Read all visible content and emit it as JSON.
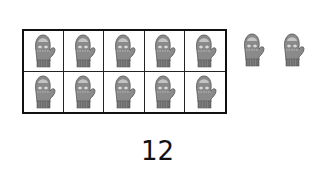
{
  "ten_frame": {
    "rows": 2,
    "columns": 5,
    "cells": [
      {
        "filled": true
      },
      {
        "filled": true
      },
      {
        "filled": true
      },
      {
        "filled": true
      },
      {
        "filled": true
      },
      {
        "filled": true
      },
      {
        "filled": true
      },
      {
        "filled": true
      },
      {
        "filled": true
      },
      {
        "filled": true
      }
    ],
    "item_icon": "mitten-icon"
  },
  "extra_items": [
    {
      "icon": "mitten-icon"
    },
    {
      "icon": "mitten-icon"
    }
  ],
  "total_count": "12",
  "colors": {
    "mitten_body": "#8a8a8a",
    "mitten_cuff": "#6e6e6e",
    "mitten_top": "#b5b5b5",
    "border": "#111111"
  }
}
